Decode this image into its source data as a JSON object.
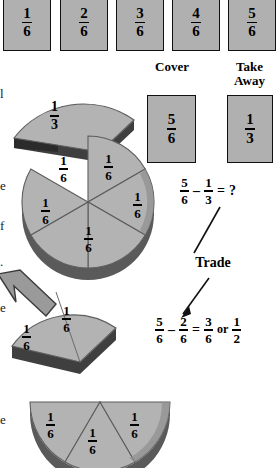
{
  "page": {
    "background_color": "#ffffff",
    "piece_face_color": "#b3b3b3",
    "piece_edge_color": "#6e6e6e",
    "piece_side_color": "#4a4a4a",
    "outline_color": "#101010"
  },
  "top_row": {
    "name": "fraction-card-row",
    "cards": [
      {
        "numerator": "1",
        "denominator": "6"
      },
      {
        "numerator": "2",
        "denominator": "6"
      },
      {
        "numerator": "3",
        "denominator": "6"
      },
      {
        "numerator": "4",
        "denominator": "6"
      },
      {
        "numerator": "5",
        "denominator": "6"
      }
    ]
  },
  "cover": {
    "label": "Cover",
    "card": {
      "numerator": "5",
      "denominator": "6"
    }
  },
  "take_away": {
    "label_line1": "Take",
    "label_line2": "Away",
    "card": {
      "numerator": "1",
      "denominator": "3"
    }
  },
  "equation_top": {
    "left": {
      "numerator": "5",
      "denominator": "6"
    },
    "operator": "–",
    "right": {
      "numerator": "1",
      "denominator": "3"
    },
    "equals": "=",
    "result": "?"
  },
  "trade": {
    "label": "Trade"
  },
  "equation_bottom": {
    "left": {
      "numerator": "5",
      "denominator": "6"
    },
    "operator": "–",
    "right": {
      "numerator": "2",
      "denominator": "6"
    },
    "equals": "=",
    "result": {
      "numerator": "3",
      "denominator": "6"
    },
    "conjunction": "or",
    "alt_result": {
      "numerator": "1",
      "denominator": "2"
    }
  },
  "manipulatives": {
    "third_wedge": {
      "numerator": "1",
      "denominator": "3"
    },
    "circle_pieces": [
      {
        "numerator": "1",
        "denominator": "6"
      },
      {
        "numerator": "1",
        "denominator": "6"
      },
      {
        "numerator": "1",
        "denominator": "6"
      },
      {
        "numerator": "1",
        "denominator": "6"
      },
      {
        "numerator": "1",
        "denominator": "6"
      }
    ],
    "traded_pair": [
      {
        "numerator": "1",
        "denominator": "6"
      },
      {
        "numerator": "1",
        "denominator": "6"
      }
    ],
    "half_result": [
      {
        "numerator": "1",
        "denominator": "6"
      },
      {
        "numerator": "1",
        "denominator": "6"
      },
      {
        "numerator": "1",
        "denominator": "6"
      }
    ]
  },
  "margin_text": {
    "line1": "l",
    "line2": "e",
    "line3": "f",
    "line4": "."
  }
}
